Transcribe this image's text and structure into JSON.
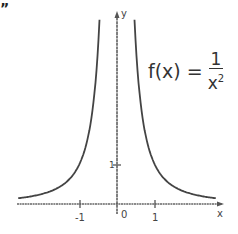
{
  "chart_data": {
    "type": "line",
    "title": "",
    "equation": {
      "lhs": "f(x) =",
      "numerator": "1",
      "denominator_base": "x",
      "denominator_exp": "2"
    },
    "xlabel": "x",
    "ylabel": "y",
    "x_ticks": [
      {
        "value": -1,
        "label": "-1"
      },
      {
        "value": 0,
        "label": "0"
      },
      {
        "value": 1,
        "label": "1"
      }
    ],
    "y_ticks": [
      {
        "value": 1,
        "label": "1"
      }
    ],
    "xlim": [
      -2.6,
      2.8
    ],
    "ylim": [
      0,
      4.9
    ],
    "grid": false,
    "legend": "none",
    "series": [
      {
        "name": "f(x) = 1/x^2 (x<0)",
        "x": [
          -2.6,
          -2,
          -1.5,
          -1,
          -0.8,
          -0.7,
          -0.6,
          -0.5,
          -0.46
        ],
        "y": [
          0.15,
          0.25,
          0.44,
          1,
          1.56,
          2.04,
          2.78,
          4,
          4.73
        ]
      },
      {
        "name": "f(x) = 1/x^2 (x>0)",
        "x": [
          0.46,
          0.5,
          0.6,
          0.7,
          0.8,
          1,
          1.5,
          2,
          2.6
        ],
        "y": [
          4.73,
          4,
          2.78,
          2.04,
          1.56,
          1,
          0.44,
          0.25,
          0.15
        ]
      }
    ],
    "colors": {
      "curve": "#444444",
      "axis": "#555555"
    }
  },
  "corner_mark": "”"
}
